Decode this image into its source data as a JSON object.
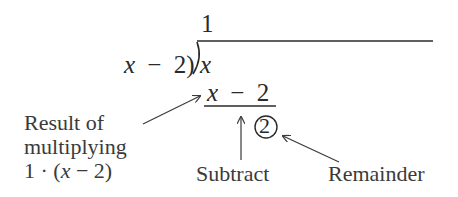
{
  "division": {
    "quotient": "1",
    "divisor_var": "x",
    "divisor_op": "−",
    "divisor_num": "2)",
    "dividend": "x",
    "product_var": "x",
    "product_op": "−",
    "product_num": "2",
    "remainder": "2"
  },
  "annotations": {
    "result_line1": "Result of",
    "result_line2": "multiplying",
    "result_line3_pre": "1 · (",
    "result_line3_var": "x",
    "result_line3_post": " − 2)",
    "subtract": "Subtract",
    "remainder": "Remainder"
  },
  "colors": {
    "ink": "#2a2a2a",
    "label": "#3a3a3a"
  }
}
